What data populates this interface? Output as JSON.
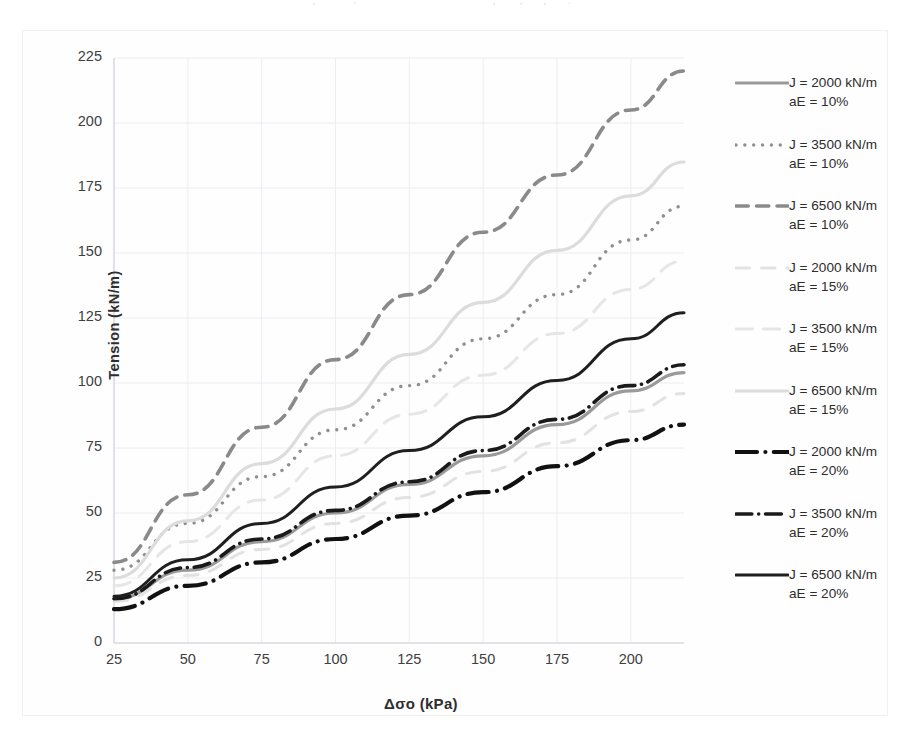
{
  "chart_data": {
    "type": "line",
    "title": "",
    "xlabel": "Δσo (kPa)",
    "ylabel": "Tension (kN/m)",
    "xlim": [
      25,
      218
    ],
    "ylim": [
      0,
      225
    ],
    "xticks": [
      "25",
      "50",
      "75",
      "100",
      "125",
      "150",
      "175",
      "200"
    ],
    "yticks": [
      "225",
      "200",
      "175",
      "150",
      "125",
      "100",
      "75",
      "50",
      "25",
      "0"
    ],
    "grid": true,
    "legend_position": "right",
    "x": [
      25,
      50,
      75,
      100,
      125,
      150,
      175,
      200,
      218
    ],
    "series": [
      {
        "name": "J = 2000 kN/m aE = 10%",
        "label_line1": "J = 2000 kN/m",
        "label_line2": "aE = 10%",
        "style": "solid",
        "color": "#9a9a9a",
        "width": 3.2,
        "values": [
          17,
          28,
          39,
          50,
          61,
          72,
          84,
          97,
          104
        ]
      },
      {
        "name": "J = 3500 kN/m aE = 10%",
        "label_line1": "J = 3500 kN/m",
        "label_line2": "aE = 10%",
        "style": "dotted",
        "color": "#8f8f8f",
        "width": 3.4,
        "values": [
          28,
          46,
          64,
          82,
          99,
          117,
          134,
          155,
          168
        ]
      },
      {
        "name": "J = 6500 kN/m aE = 10%",
        "label_line1": "J = 6500 kN/m",
        "label_line2": "aE = 10%",
        "style": "dashed",
        "color": "#8a8a8a",
        "width": 3.6,
        "values": [
          31,
          57,
          83,
          109,
          134,
          158,
          180,
          205,
          220
        ]
      },
      {
        "name": "J = 2000 kN/m aE = 15%",
        "label_line1": "J = 2000 kN/m",
        "label_line2": "aE = 15%",
        "style": "longdash",
        "color": "#e2e2e2",
        "width": 3.0,
        "values": [
          16,
          26,
          36,
          46,
          56,
          66,
          77,
          89,
          96
        ]
      },
      {
        "name": "J = 3500 kN/m aE = 15%",
        "label_line1": "J = 3500 kN/m",
        "label_line2": "aE = 15%",
        "style": "longdash2",
        "color": "#e6e6e6",
        "width": 3.0,
        "values": [
          22,
          39,
          55,
          72,
          88,
          103,
          119,
          136,
          147
        ]
      },
      {
        "name": "J = 6500 kN/m aE = 15%",
        "label_line1": "J = 6500 kN/m",
        "label_line2": "aE = 15%",
        "style": "solid",
        "color": "#dcdcdc",
        "width": 3.2,
        "values": [
          25,
          47,
          69,
          90,
          111,
          131,
          151,
          172,
          185
        ]
      },
      {
        "name": "J = 2000 kN/m aE = 20%",
        "label_line1": "J = 2000 kN/m",
        "label_line2": "aE = 20%",
        "style": "dashdot",
        "color": "#111111",
        "width": 4.2,
        "values": [
          13,
          22,
          31,
          40,
          49,
          58,
          68,
          78,
          84
        ]
      },
      {
        "name": "J = 3500 kN/m aE = 20%",
        "label_line1": "J = 3500 kN/m",
        "label_line2": "aE = 20%",
        "style": "dashdot2",
        "color": "#1a1a1a",
        "width": 3.6,
        "values": [
          17,
          29,
          40,
          51,
          62,
          74,
          86,
          99,
          107
        ]
      },
      {
        "name": "J = 6500 kN/m aE = 20%",
        "label_line1": "J = 6500 kN/m",
        "label_line2": "aE = 20%",
        "style": "solid",
        "color": "#1f1f1f",
        "width": 3.0,
        "values": [
          18,
          32,
          46,
          60,
          74,
          87,
          101,
          117,
          127
        ]
      }
    ]
  }
}
